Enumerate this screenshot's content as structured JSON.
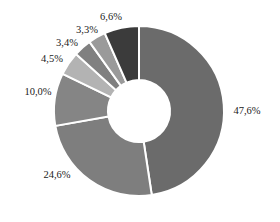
{
  "chart_data": {
    "type": "pie",
    "variant": "donut",
    "title": "",
    "start_angle_deg": 0,
    "direction": "clockwise",
    "categories": [
      "Slice 1",
      "Slice 2",
      "Slice 3",
      "Slice 4",
      "Slice 5",
      "Slice 6",
      "Slice 7"
    ],
    "values": [
      47.6,
      24.6,
      10.0,
      4.5,
      3.4,
      3.3,
      6.6
    ],
    "labels": [
      "47,6%",
      "24,6%",
      "10,0%",
      "4,5%",
      "3,4%",
      "3,3%",
      "6,6%"
    ],
    "colors": [
      "#6b6b6b",
      "#7e7e7e",
      "#858585",
      "#b3b3b3",
      "#808080",
      "#9a9a9a",
      "#3b3b3b"
    ],
    "legend": null,
    "label_position": "outside"
  },
  "geometry": {
    "cx": 139,
    "cy": 111,
    "outer_r": 85,
    "inner_r": 31,
    "separator_color": "#ffffff",
    "separator_width": 2
  }
}
